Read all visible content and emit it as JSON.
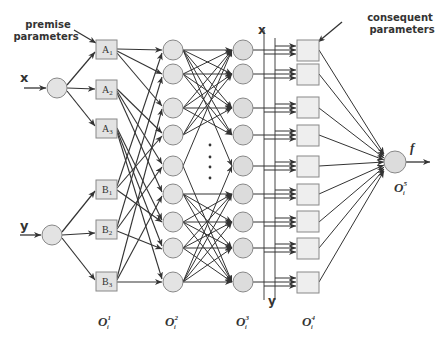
{
  "labels": {
    "premise_parameters_line1": "premise",
    "premise_parameters_line2": "parameters",
    "consequent_parameters_line1": "consequent",
    "consequent_parameters_line2": "parameters",
    "input_x": "x",
    "input_y": "y",
    "bus_x": "x",
    "bus_y": "y",
    "output_f": "f",
    "ellipsis": "⋮"
  },
  "layer1_nodes": [
    "A",
    "A",
    "A",
    "B",
    "B",
    "B"
  ],
  "layer1_subscripts": [
    "1",
    "2",
    "3",
    "1",
    "2",
    "3"
  ],
  "layer_labels": [
    {
      "base": "O",
      "sup": "1",
      "sub": "i"
    },
    {
      "base": "O",
      "sup": "2",
      "sub": "i"
    },
    {
      "base": "O",
      "sup": "3",
      "sub": "i"
    },
    {
      "base": "O",
      "sup": "4",
      "sub": "i"
    },
    {
      "base": "O",
      "sup": "5",
      "sub": "i"
    }
  ],
  "colors": {
    "node_fill": "#e3e3e3",
    "node_stroke": "#888888",
    "line": "#333333"
  }
}
